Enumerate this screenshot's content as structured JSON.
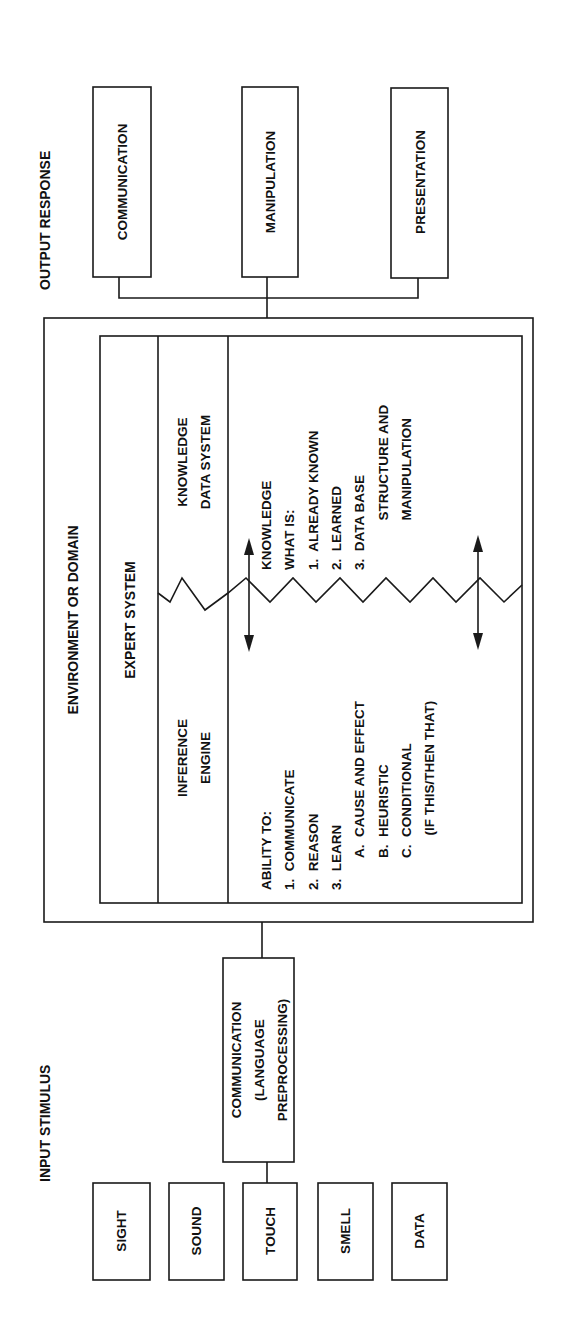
{
  "diagram": {
    "output_response": {
      "heading": "OUTPUT RESPONSE",
      "boxes": [
        "COMMUNICATION",
        "MANIPULATION",
        "PRESENTATION"
      ]
    },
    "environment": {
      "heading": "ENVIRONMENT OR DOMAIN",
      "expert_system": {
        "heading": "EXPERT SYSTEM",
        "inference_engine": {
          "title_lines": [
            "INFERENCE",
            "ENGINE"
          ],
          "body_lines": [
            "ABILITY TO:",
            "1.  COMMUNICATE",
            "2.  REASON",
            "3.  LEARN",
            "A.  CAUSE AND EFFECT",
            "B.  HEURISTIC",
            "C.  CONDITIONAL",
            "      (IF THIS/THEN THAT)"
          ]
        },
        "knowledge_data_system": {
          "title_lines": [
            "KNOWLEDGE",
            "DATA SYSTEM"
          ],
          "body_lines": [
            "KNOWLEDGE",
            "WHAT IS:",
            "1.  ALREADY KNOWN",
            "2.  LEARNED",
            "3.  DATA BASE",
            "      STRUCTURE AND",
            "      MANIPULATION"
          ]
        }
      }
    },
    "input_stimulus": {
      "heading": "INPUT STIMULUS",
      "preprocessing_box_lines": [
        "COMMUNICATION",
        "(LANGUAGE",
        "PREPROCESSING)"
      ],
      "boxes": [
        "SIGHT",
        "SOUND",
        "TOUCH",
        "SMELL",
        "DATA"
      ]
    },
    "colors": {
      "ink": "#1a1a1a",
      "background": "#ffffff"
    }
  }
}
